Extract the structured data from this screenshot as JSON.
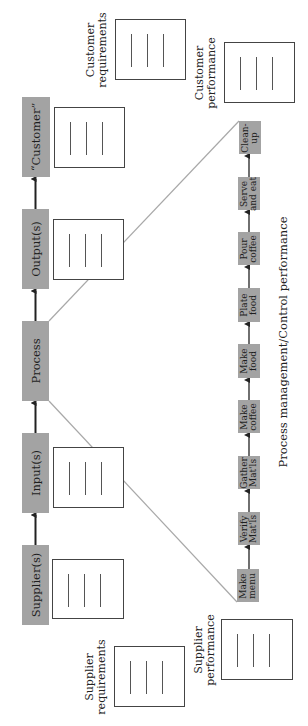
{
  "diagram": {
    "orientation": "rotated 90 degrees counter-clockwise",
    "main_chain": [
      {
        "id": "supplier",
        "label": "Supplier(s)"
      },
      {
        "id": "input",
        "label": "Input(s)"
      },
      {
        "id": "process",
        "label": "Process"
      },
      {
        "id": "output",
        "label": "Output(s)"
      },
      {
        "id": "customer",
        "label": "“Customer”"
      }
    ],
    "sub_process": [
      {
        "id": "make-menu",
        "label": "Make\nmenu"
      },
      {
        "id": "verify-matls",
        "label": "Verify\nMat'ls"
      },
      {
        "id": "gather-matls",
        "label": "Gather\nMat'ls"
      },
      {
        "id": "make-coffee",
        "label": "Make\ncoffee"
      },
      {
        "id": "make-food",
        "label": "Make\nfood"
      },
      {
        "id": "plate-food",
        "label": "Plate\nfood"
      },
      {
        "id": "pour-coffee",
        "label": "Pour\ncoffee"
      },
      {
        "id": "serve-and-eat",
        "label": "Serve\nand eat"
      },
      {
        "id": "clean-up",
        "label": "Clean-\nup"
      }
    ],
    "captions": {
      "customer_requirements": "Customer\nrequirements",
      "customer_performance": "Customer\nperformance",
      "supplier_requirements": "Supplier\nrequirements",
      "supplier_performance": "Supplier\nperformance",
      "process_management": "Process management/Control performance"
    },
    "colors": {
      "box_fill": "#a3a3a3",
      "arrow": "#222222",
      "zoom_lines": "#a8a8a8",
      "doc_border": "#444444"
    }
  }
}
